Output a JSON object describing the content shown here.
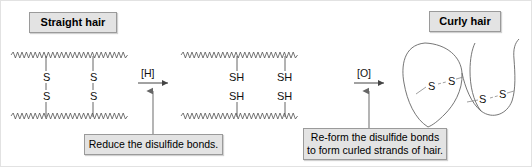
{
  "figure": {
    "background_color": "#ffffff",
    "border_color": "#e2e2e2"
  },
  "labels": {
    "straight_hair": "Straight hair",
    "curly_hair": "Curly hair"
  },
  "captions": {
    "reduce": {
      "line1": "Reduce the disulfide bonds."
    },
    "reform": {
      "line1": "Re-form the disulfide bonds",
      "line2": "to form curled strands of hair."
    }
  },
  "reagents": {
    "reduction": "[H]",
    "oxidation": "[O]"
  },
  "stages": [
    {
      "id": "straight-hair",
      "name": "Straight hair",
      "strand_shape": "straight-zigzag",
      "bridges": [
        {
          "id": "bridge-left",
          "top_atom": "S",
          "bottom_atom": "S",
          "bond": "disulfide"
        },
        {
          "id": "bridge-right",
          "top_atom": "S",
          "bottom_atom": "S",
          "bond": "disulfide"
        }
      ]
    },
    {
      "id": "reduced-hair",
      "name": "Reduced hair (thiols)",
      "strand_shape": "straight-zigzag",
      "bridges": [
        {
          "id": "thiol-top-left",
          "atom": "SH"
        },
        {
          "id": "thiol-top-right",
          "atom": "SH"
        },
        {
          "id": "thiol-bottom-left",
          "atom": "SH"
        },
        {
          "id": "thiol-bottom-right",
          "atom": "SH"
        }
      ]
    },
    {
      "id": "curly-hair",
      "name": "Curly hair",
      "strand_shape": "curved-loops",
      "bridges": [
        {
          "id": "curl-bridge-left",
          "left_atom": "S",
          "right_atom": "S",
          "bond": "disulfide"
        },
        {
          "id": "curl-bridge-right",
          "left_atom": "S",
          "right_atom": "S",
          "bond": "disulfide"
        }
      ]
    }
  ],
  "atoms": {
    "straight": {
      "left_top": "S",
      "left_bottom": "S",
      "right_top": "S",
      "right_bottom": "S"
    },
    "reduced": {
      "left_top": "SH",
      "left_bottom": "SH",
      "right_top": "SH",
      "right_bottom": "SH"
    },
    "curly": {
      "bridge1_left": "S",
      "bridge1_right": "S",
      "bridge2_left": "S",
      "bridge2_right": "S"
    }
  },
  "colors": {
    "box_fill": "#e3e3e3",
    "box_border": "#9a9a9a",
    "stroke": "#555555",
    "text": "#000000"
  }
}
